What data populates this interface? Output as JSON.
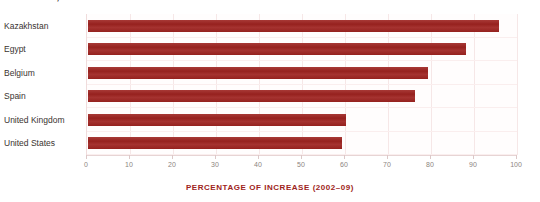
{
  "chart": {
    "title": "Kazakhstan, 2002–09",
    "xlabel": "PERCENTAGE OF INCREASE (2002–09)",
    "accent_color": "#9e2320",
    "label_color": "#3a3330",
    "grid_color": "#f6e7e7"
  },
  "chart_data": {
    "type": "bar",
    "orientation": "horizontal",
    "title": "Kazakhstan, 2002–09",
    "xlabel": "PERCENTAGE OF INCREASE (2002–09)",
    "ylabel": "",
    "categories": [
      "Kazakhstan",
      "Egypt",
      "Belgium",
      "Spain",
      "United Kingdom",
      "United States"
    ],
    "values": [
      95.5,
      88,
      79,
      76,
      60,
      59
    ],
    "xlim": [
      0,
      100
    ],
    "xticks": [
      0,
      10,
      20,
      30,
      40,
      50,
      60,
      70,
      80,
      90,
      100
    ],
    "xticklabels": [
      "0",
      "10",
      "20",
      "30",
      "40",
      "50",
      "60",
      "70",
      "80",
      "90",
      "100"
    ],
    "grid": true,
    "legend": false,
    "series": [
      {
        "name": "Percentage of increase (2002-09)",
        "color": "#9e2320",
        "values": [
          95.5,
          88,
          79,
          76,
          60,
          59
        ]
      }
    ]
  }
}
